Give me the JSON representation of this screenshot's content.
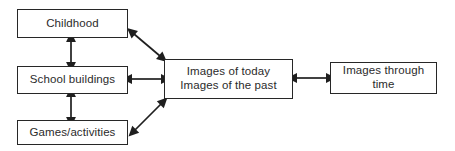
{
  "diagram": {
    "background_color": "#ffffff",
    "box_border_color": "#272727",
    "text_color": "#2b2b2b",
    "arrow_color": "#1f1f1f",
    "nodes": [
      {
        "id": "childhood",
        "label": "Childhood"
      },
      {
        "id": "school_buildings",
        "label": "School buildings"
      },
      {
        "id": "games_activities",
        "label": "Games/activities"
      },
      {
        "id": "images_today_past",
        "label": "Images of today\nImages of the past"
      },
      {
        "id": "images_through_time",
        "label": "Images through time"
      }
    ],
    "connectors": [
      {
        "id": "childhood-school",
        "from": "childhood",
        "to": "school_buildings",
        "style": "double-headed",
        "orientation": "vertical"
      },
      {
        "id": "school-games",
        "from": "school_buildings",
        "to": "games_activities",
        "style": "double-headed",
        "orientation": "vertical"
      },
      {
        "id": "school-images",
        "from": "school_buildings",
        "to": "images_today_past",
        "style": "double-headed",
        "orientation": "horizontal"
      },
      {
        "id": "childhood-images",
        "from": "childhood",
        "to": "images_today_past",
        "style": "double-headed",
        "orientation": "diagonal-down"
      },
      {
        "id": "games-images",
        "from": "games_activities",
        "to": "images_today_past",
        "style": "double-headed",
        "orientation": "diagonal-up"
      },
      {
        "id": "images-through-time-link",
        "from": "images_today_past",
        "to": "images_through_time",
        "style": "double-headed",
        "orientation": "horizontal"
      }
    ]
  }
}
